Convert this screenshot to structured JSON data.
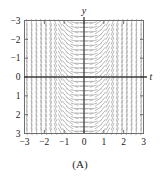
{
  "figure": {
    "caption": "(A)",
    "axis_labels": {
      "x": "t",
      "y": "y"
    },
    "x_ticks": [
      "−3",
      "−2",
      "−1",
      "0",
      "1",
      "2",
      "3"
    ],
    "y_ticks": [
      "3",
      "2",
      "1",
      "0",
      "−1",
      "−2",
      "−3"
    ],
    "colors": {
      "axis": "#3a3a3a",
      "frame": "#6e6e6e",
      "field": "#a8a8a8",
      "text": "#1a1a1a",
      "background": "#ffffff"
    }
  },
  "chart_data": {
    "type": "scatter",
    "subtype": "slope-field",
    "title": "",
    "xlabel": "t",
    "ylabel": "y",
    "xlim": [
      -3,
      3
    ],
    "ylim": [
      -3,
      3
    ],
    "xticks": [
      -3,
      -2,
      -1,
      0,
      1,
      2,
      3
    ],
    "yticks": [
      -3,
      -2,
      -1,
      0,
      1,
      2,
      3
    ],
    "grid": false,
    "legend": null,
    "annotations": [
      "(A)"
    ],
    "slope_model": "dy/dt = k*t*t, segments tilt upward with magnitude increasing in |t|",
    "segment_grid": {
      "t_count": 25,
      "y_count": 25,
      "t_from": -3,
      "t_to": 3,
      "y_from": -3,
      "y_to": 3
    },
    "sample_slopes": [
      {
        "t": -3,
        "slope": -9
      },
      {
        "t": -2,
        "slope": -4
      },
      {
        "t": -1,
        "slope": -1
      },
      {
        "t": 0,
        "slope": 0
      },
      {
        "t": 1,
        "slope": 1
      },
      {
        "t": 2,
        "slope": 4
      },
      {
        "t": 3,
        "slope": 9
      }
    ]
  }
}
